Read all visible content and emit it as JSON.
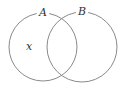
{
  "diagram": {
    "type": "venn",
    "sets": [
      {
        "label": "A",
        "cx": 43,
        "cy": 47,
        "r": 34
      },
      {
        "label": "B",
        "cx": 82,
        "cy": 47,
        "r": 35
      }
    ],
    "annotations": [
      {
        "text": "x",
        "region": "A only",
        "x": 29,
        "y": 50
      }
    ],
    "stroke_color": "#8a8a8a",
    "label_color": "#333333"
  }
}
